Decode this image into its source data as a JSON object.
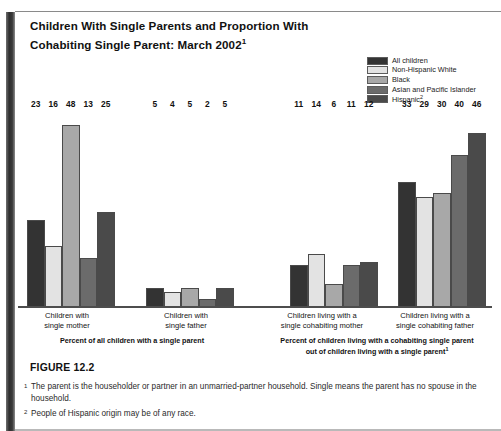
{
  "title": {
    "line1": "Children With Single Parents and Proportion With",
    "line2": "Cohabiting Single Parent: March 2002",
    "superscript": "1"
  },
  "figure_number": "FIGURE 12.2",
  "footnotes": [
    {
      "mark": "1",
      "text": "The parent is the householder or partner in an unmarried-partner household. Single means the parent has no spouse in the household."
    },
    {
      "mark": "2",
      "text": "People of Hispanic origin may be of any race."
    }
  ],
  "chart_data": {
    "type": "bar",
    "title": "Children With Single Parents and Proportion With Cohabiting Single Parent: March 2002",
    "xlabel": "",
    "ylabel": "",
    "ylim": [
      0,
      52
    ],
    "grid": false,
    "legend_position": "top-right",
    "categories": [
      "Children with single mother",
      "Children with single father",
      "Children living with a single cohabiting mother",
      "Children living with a single cohabiting father"
    ],
    "category_lines": [
      [
        "Children with",
        "single mother"
      ],
      [
        "Children with",
        "single father"
      ],
      [
        "Children living with a",
        "single cohabiting mother"
      ],
      [
        "Children living with a",
        "single cohabiting father"
      ]
    ],
    "series": [
      {
        "name": "All children",
        "color": "#333333",
        "values": [
          23,
          5,
          11,
          33
        ]
      },
      {
        "name": "Non-Hispanic White",
        "color": "#e3e3e3",
        "values": [
          16,
          4,
          14,
          29
        ]
      },
      {
        "name": "Black",
        "color": "#a8a8a8",
        "values": [
          48,
          5,
          6,
          30
        ]
      },
      {
        "name": "Asian and Pacific Islander",
        "color": "#6b6b6b",
        "values": [
          13,
          2,
          11,
          40
        ]
      },
      {
        "name": "Hispanic",
        "color": "#4a4a4a",
        "values": [
          25,
          5,
          12,
          46
        ],
        "superscript": "2"
      }
    ],
    "panels": [
      {
        "label_lines": [
          "Percent of all children with a single parent"
        ],
        "superscript": ""
      },
      {
        "label_lines": [
          "Percent of children living with a cohabiting single parent",
          "out of children living with a single parent"
        ],
        "superscript": "1"
      }
    ]
  }
}
